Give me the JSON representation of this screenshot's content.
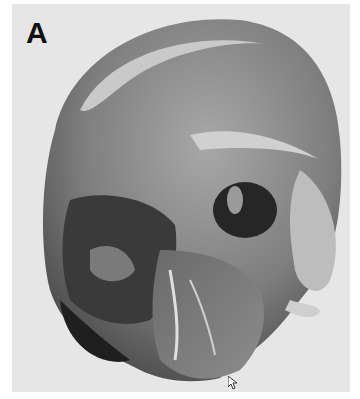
{
  "figure": {
    "panel_label": "A",
    "colors": {
      "background": "#ffffff",
      "panel_background": "#e6e6e6",
      "skull_mid": "#8a8a8a",
      "skull_dark": "#2a2a2a",
      "skull_light": "#d8d8d8",
      "label": "#111111"
    }
  }
}
